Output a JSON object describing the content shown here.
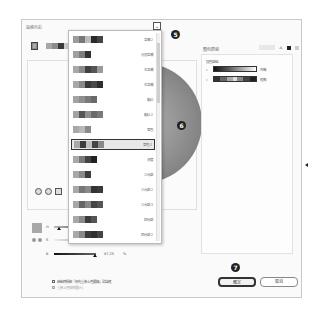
{
  "dialog": {
    "title": "編輯色彩"
  },
  "current_color": {
    "swatch_color": "#8a8a8a",
    "harmony_strip": [
      "#a6a6a6",
      "#8c8c8c",
      "#3a3a3a",
      "#c9c9c9",
      "#5a5a5a",
      "#7a7a7a"
    ]
  },
  "harmony_dropdown": {
    "toggle_icon": "chevron-down-icon",
    "badge": "5",
    "selected_index": 7,
    "selected_badge": "6",
    "items": [
      {
        "label": "互補 2",
        "swatches": [
          "#9c9c9c",
          "#777777",
          "#bcbcbc",
          "#2a2a2a",
          "#444444"
        ]
      },
      {
        "label": "分割互補",
        "swatches": [
          "#a0a0a0",
          "#7e7e7e",
          "#333333"
        ]
      },
      {
        "label": "左互補",
        "swatches": [
          "#a8a8a8",
          "#8a8a8a",
          "#404040",
          "#555555",
          "#9a9a9a"
        ]
      },
      {
        "label": "右互補",
        "swatches": [
          "#a8a8a8",
          "#8a8a8a",
          "#3a3a3a",
          "#4a4a4a",
          "#2e2e2e"
        ]
      },
      {
        "label": "類比",
        "swatches": [
          "#a3a3a3",
          "#8f8f8f",
          "#7a7a7a",
          "#6a6a6a"
        ]
      },
      {
        "label": "類比 2",
        "swatches": [
          "#a3a3a3",
          "#555555",
          "#8f8f8f",
          "#6a6a6a",
          "#7a7a7a"
        ]
      },
      {
        "label": "單色",
        "swatches": [
          "#a8a8a8",
          "#b8b8b8",
          "#8a8a8a"
        ]
      },
      {
        "label": "單色 2",
        "swatches": [
          "#a8a8a8",
          "#3c3c3c",
          "#c0c0c0",
          "#444444",
          "#888888"
        ]
      },
      {
        "label": "濃度",
        "swatches": [
          "#a8a8a8",
          "#7a7a7a",
          "#444444",
          "#222222"
        ]
      },
      {
        "label": "三元群",
        "swatches": [
          "#a8a8a8",
          "#8a8a8a",
          "#3e3e3e"
        ]
      },
      {
        "label": "三元群 2",
        "swatches": [
          "#a8a8a8",
          "#777777",
          "#8a8a8a",
          "#333333",
          "#3a3a3a"
        ]
      },
      {
        "label": "三元群 3",
        "swatches": [
          "#a8a8a8",
          "#666666",
          "#888888",
          "#444444",
          "#555555"
        ]
      },
      {
        "label": "四元群",
        "swatches": [
          "#a8a8a8",
          "#8a8a8a",
          "#3c3c3c",
          "#555555"
        ]
      },
      {
        "label": "四元群 2",
        "swatches": [
          "#a8a8a8",
          "#888888",
          "#3a3a3a",
          "#2e2e2e",
          "#444444"
        ]
      }
    ]
  },
  "mode_icons": [
    "color-wheel-icon",
    "smooth-wheel-icon",
    "color-bars-icon"
  ],
  "right_panel": {
    "header": "顏色群組",
    "tool_button": "新增",
    "group_label": "顏色群組",
    "items": [
      {
        "name": "灰階",
        "expand_icon": "chevron-right-icon",
        "gradient": "linear-gradient(90deg,#111,#555,#aaa,#fff)"
      },
      {
        "name": "暗亮",
        "expand_icon": "chevron-right-icon",
        "gradient": "linear-gradient(90deg,#333 0 15%,#666 15% 30%,#aaa 30% 45%,#ddd 45% 55%,#888 55% 70%,#444 70% 85%,#222 85%)"
      }
    ]
  },
  "sliders": {
    "h": {
      "label": "H",
      "value": "40.45",
      "unit": "°",
      "extra": "30",
      "knob_pct": 11
    },
    "s": {
      "label": "S",
      "value": "81.85",
      "unit": "%",
      "knob_pct": 82
    },
    "b": {
      "label": "B",
      "value": "97.25",
      "unit": "%",
      "knob_pct": 97
    }
  },
  "options": [
    {
      "label": "啟動時開啟「預先重新上色圖稿」對話框",
      "checked": false,
      "enabled": true
    },
    {
      "label": "重新上色線條圖(R)",
      "checked": true,
      "enabled": false
    }
  ],
  "buttons": {
    "ok": "確定",
    "cancel": "取消",
    "ok_badge": "7"
  }
}
